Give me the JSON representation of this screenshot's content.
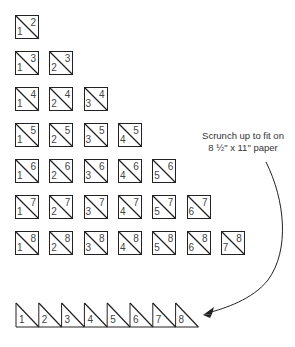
{
  "diagram": {
    "rows": [
      {
        "top": 2,
        "bottoms": [
          1
        ]
      },
      {
        "top": 3,
        "bottoms": [
          1,
          2
        ]
      },
      {
        "top": 4,
        "bottoms": [
          1,
          2,
          3
        ]
      },
      {
        "top": 5,
        "bottoms": [
          1,
          2,
          3,
          4
        ]
      },
      {
        "top": 6,
        "bottoms": [
          1,
          2,
          3,
          4,
          5
        ]
      },
      {
        "top": 7,
        "bottoms": [
          1,
          2,
          3,
          4,
          5,
          6
        ]
      },
      {
        "top": 8,
        "bottoms": [
          1,
          2,
          3,
          4,
          5,
          6,
          7
        ]
      }
    ],
    "annotation": {
      "line1": "Scrunch up to fit on",
      "line2": "8 ½\" x 11\" paper"
    },
    "strip": {
      "labels": [
        "1",
        "2",
        "3",
        "4",
        "5",
        "6",
        "7",
        "8"
      ]
    },
    "colors": {
      "stroke": "#222222",
      "text": "#444444",
      "background": "#ffffff"
    }
  }
}
